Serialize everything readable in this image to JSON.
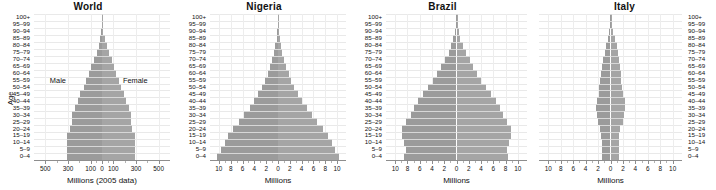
{
  "figure": {
    "y_axis_label": "Age",
    "age_groups": [
      "100+",
      "95–99",
      "90–94",
      "85–89",
      "80–84",
      "75–79",
      "70–74",
      "65–69",
      "60–64",
      "55–59",
      "50–54",
      "45–49",
      "40–44",
      "35–39",
      "30–34",
      "25–29",
      "20–24",
      "15–19",
      "10–14",
      "5–9",
      "0–4"
    ],
    "series_labels": {
      "male": "Male",
      "female": "Female"
    },
    "bar_color": "#9b9b9b",
    "grid_color": "#e9e9e9",
    "axis_color": "#8d8d8d"
  },
  "chart_data": [
    {
      "type": "bar",
      "title": "World",
      "xlabel": "Millions (2005 data)",
      "ylabel": "Age",
      "xlim": [
        -600,
        600
      ],
      "xticks": [
        -500,
        -300,
        -100,
        0,
        100,
        300,
        500
      ],
      "xticklabels": [
        "500",
        "300",
        "100",
        "0",
        "100",
        "300",
        "500"
      ],
      "grid": true,
      "legend": [
        "Male",
        "Female"
      ],
      "categories": [
        "100+",
        "95–99",
        "90–94",
        "85–89",
        "80–84",
        "75–79",
        "70–74",
        "65–69",
        "60–64",
        "55–59",
        "50–54",
        "45–49",
        "40–44",
        "35–39",
        "30–34",
        "25–29",
        "20–24",
        "15–19",
        "10–14",
        "5–9",
        "0–4"
      ],
      "series": [
        {
          "name": "Male",
          "values": [
            1,
            3,
            7,
            15,
            30,
            48,
            72,
            96,
            118,
            140,
            163,
            190,
            215,
            240,
            262,
            268,
            283,
            305,
            312,
            312,
            310
          ]
        },
        {
          "name": "Female",
          "values": [
            2,
            6,
            13,
            24,
            42,
            62,
            86,
            107,
            126,
            146,
            167,
            191,
            213,
            234,
            252,
            256,
            269,
            288,
            293,
            293,
            291
          ]
        }
      ]
    },
    {
      "type": "bar",
      "title": "Nigeria",
      "xlabel": "Millions",
      "ylabel": "Age",
      "xlim": [
        -11.5,
        11.5
      ],
      "xticks": [
        -10,
        -8,
        -6,
        -4,
        -2,
        0,
        2,
        4,
        6,
        8,
        10
      ],
      "xticklabels": [
        "10",
        "8",
        "6",
        "4",
        "2",
        "0",
        "2",
        "4",
        "6",
        "8",
        "10"
      ],
      "grid": true,
      "categories": [
        "100+",
        "95–99",
        "90–94",
        "85–89",
        "80–84",
        "75–79",
        "70–74",
        "65–69",
        "60–64",
        "55–59",
        "50–54",
        "45–49",
        "40–44",
        "35–39",
        "30–34",
        "25–29",
        "20–24",
        "15–19",
        "10–14",
        "5–9",
        "0–4"
      ],
      "series": [
        {
          "name": "Male",
          "values": [
            0.02,
            0.05,
            0.12,
            0.25,
            0.45,
            0.7,
            1.0,
            1.35,
            1.75,
            2.2,
            2.7,
            3.3,
            4.0,
            4.8,
            5.7,
            6.6,
            7.6,
            8.4,
            9.0,
            9.6,
            10.3
          ]
        },
        {
          "name": "Female",
          "values": [
            0.02,
            0.06,
            0.14,
            0.28,
            0.5,
            0.76,
            1.05,
            1.4,
            1.8,
            2.25,
            2.75,
            3.35,
            4.05,
            4.85,
            5.75,
            6.65,
            7.65,
            8.45,
            9.05,
            9.65,
            10.35
          ]
        }
      ]
    },
    {
      "type": "bar",
      "title": "Brazil",
      "xlabel": "Millions",
      "ylabel": "Age",
      "xlim": [
        -11.5,
        11.5
      ],
      "xticks": [
        -10,
        -8,
        -6,
        -4,
        -2,
        0,
        2,
        4,
        6,
        8,
        10
      ],
      "xticklabels": [
        "10",
        "8",
        "6",
        "4",
        "2",
        "0",
        "2",
        "4",
        "6",
        "8",
        "10"
      ],
      "grid": true,
      "categories": [
        "100+",
        "95–99",
        "90–94",
        "85–89",
        "80–84",
        "75–79",
        "70–74",
        "65–69",
        "60–64",
        "55–59",
        "50–54",
        "45–49",
        "40–44",
        "35–39",
        "30–34",
        "25–29",
        "20–24",
        "15–19",
        "10–14",
        "5–9",
        "0–4"
      ],
      "series": [
        {
          "name": "Male",
          "values": [
            0.03,
            0.1,
            0.25,
            0.5,
            0.9,
            1.3,
            1.9,
            2.5,
            3.1,
            3.8,
            4.6,
            5.4,
            6.2,
            6.9,
            7.4,
            8.2,
            8.9,
            8.9,
            8.5,
            8.3,
            8.6
          ]
        },
        {
          "name": "Female",
          "values": [
            0.05,
            0.15,
            0.35,
            0.65,
            1.1,
            1.55,
            2.15,
            2.75,
            3.35,
            4.05,
            4.85,
            5.6,
            6.4,
            7.1,
            7.6,
            8.3,
            8.95,
            8.95,
            8.5,
            8.2,
            8.4
          ]
        }
      ]
    },
    {
      "type": "bar",
      "title": "Italy",
      "xlabel": "Millions",
      "ylabel": "Age",
      "xlim": [
        -11.5,
        11.5
      ],
      "xticks": [
        -10,
        -8,
        -6,
        -4,
        -2,
        0,
        2,
        4,
        6,
        8,
        10
      ],
      "xticklabels": [
        "10",
        "8",
        "6",
        "4",
        "2",
        "0",
        "2",
        "4",
        "6",
        "8",
        "10"
      ],
      "grid": true,
      "categories": [
        "100+",
        "95–99",
        "90–94",
        "85–89",
        "80–84",
        "75–79",
        "70–74",
        "65–69",
        "60–64",
        "55–59",
        "50–54",
        "45–49",
        "40–44",
        "35–39",
        "30–34",
        "25–29",
        "20–24",
        "15–19",
        "10–14",
        "5–9",
        "0–4"
      ],
      "series": [
        {
          "name": "Male",
          "values": [
            0.01,
            0.05,
            0.18,
            0.42,
            0.72,
            0.92,
            1.18,
            1.42,
            1.58,
            1.68,
            1.78,
            1.9,
            2.25,
            2.35,
            2.2,
            1.95,
            1.62,
            1.45,
            1.38,
            1.38,
            1.42
          ]
        },
        {
          "name": "Female",
          "values": [
            0.03,
            0.13,
            0.35,
            0.66,
            1.0,
            1.18,
            1.38,
            1.55,
            1.68,
            1.76,
            1.84,
            1.95,
            2.28,
            2.38,
            2.22,
            1.96,
            1.6,
            1.4,
            1.32,
            1.32,
            1.35
          ]
        }
      ]
    }
  ]
}
